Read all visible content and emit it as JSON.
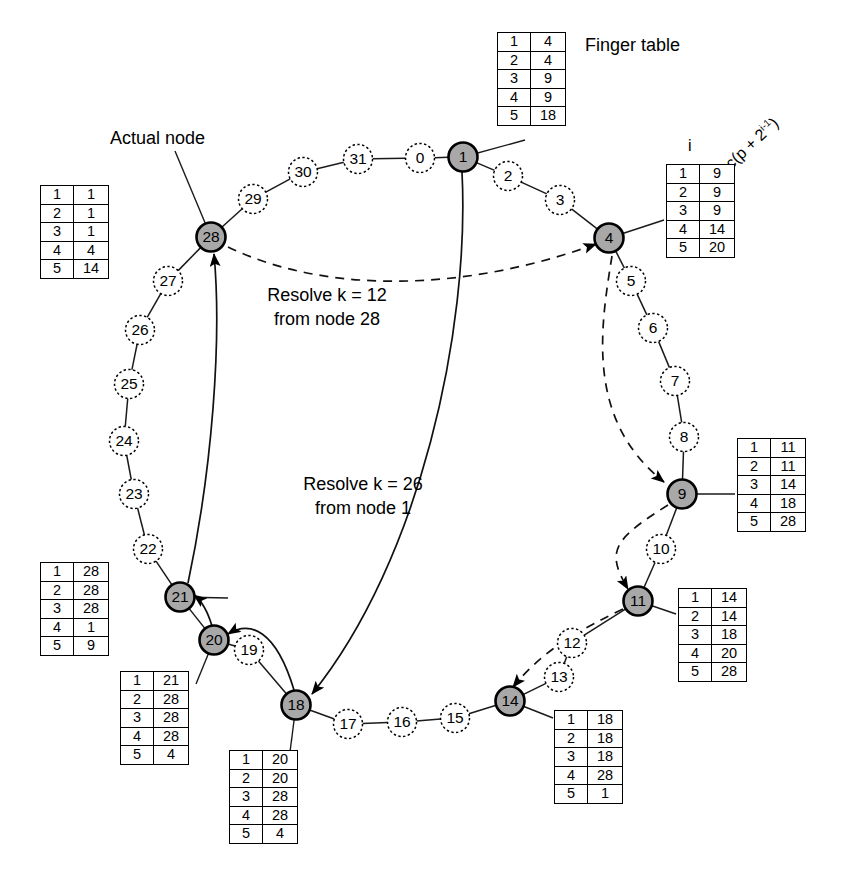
{
  "diagram": {
    "ring_size": 32,
    "annotations": {
      "actual_node": "Actual node",
      "finger_table": "Finger table",
      "header_i": "i",
      "header_succ_prefix": "succ(p + 2",
      "header_succ_sup": "i-1",
      "header_succ_suffix": ")",
      "resolve_12_line1": "Resolve k = 12",
      "resolve_12_line2": "from node 28",
      "resolve_26_line1": "Resolve k = 26",
      "resolve_26_line2": "from node 1"
    },
    "colors": {
      "actual_node_fill": "#a8a8a8",
      "virtual_node_fill": "#ffffff",
      "stroke": "#000000"
    },
    "actual_nodes": [
      1,
      4,
      9,
      11,
      14,
      18,
      20,
      21,
      28
    ],
    "virtual_nodes": [
      0,
      2,
      3,
      5,
      6,
      7,
      8,
      10,
      12,
      13,
      15,
      16,
      17,
      19,
      22,
      23,
      24,
      25,
      26,
      27,
      29,
      30,
      31
    ],
    "node_positions": {
      "0": [
        420,
        158
      ],
      "1": [
        463,
        157
      ],
      "2": [
        508,
        176
      ],
      "3": [
        560,
        200
      ],
      "4": [
        609,
        238
      ],
      "5": [
        631,
        281
      ],
      "6": [
        653,
        328
      ],
      "7": [
        675,
        381
      ],
      "8": [
        684,
        437
      ],
      "9": [
        682,
        494
      ],
      "10": [
        661,
        549
      ],
      "11": [
        638,
        601
      ],
      "12": [
        572,
        643
      ],
      "13": [
        559,
        677
      ],
      "14": [
        510,
        701
      ],
      "15": [
        455,
        718
      ],
      "16": [
        402,
        722
      ],
      "17": [
        348,
        724
      ],
      "18": [
        296,
        705
      ],
      "19": [
        249,
        650
      ],
      "20": [
        214,
        640
      ],
      "21": [
        180,
        597
      ],
      "22": [
        148,
        549
      ],
      "23": [
        134,
        494
      ],
      "24": [
        124,
        441
      ],
      "25": [
        129,
        384
      ],
      "26": [
        140,
        330
      ],
      "27": [
        168,
        281
      ],
      "28": [
        211,
        237
      ],
      "29": [
        253,
        199
      ],
      "30": [
        303,
        172
      ],
      "31": [
        358,
        159
      ]
    },
    "finger_tables": [
      {
        "node": 1,
        "rows": [
          [
            1,
            4
          ],
          [
            2,
            4
          ],
          [
            3,
            9
          ],
          [
            4,
            9
          ],
          [
            5,
            18
          ]
        ]
      },
      {
        "node": 4,
        "rows": [
          [
            1,
            9
          ],
          [
            2,
            9
          ],
          [
            3,
            9
          ],
          [
            4,
            14
          ],
          [
            5,
            20
          ]
        ]
      },
      {
        "node": 9,
        "rows": [
          [
            1,
            11
          ],
          [
            2,
            11
          ],
          [
            3,
            14
          ],
          [
            4,
            18
          ],
          [
            5,
            28
          ]
        ]
      },
      {
        "node": 11,
        "rows": [
          [
            1,
            14
          ],
          [
            2,
            14
          ],
          [
            3,
            18
          ],
          [
            4,
            20
          ],
          [
            5,
            28
          ]
        ]
      },
      {
        "node": 14,
        "rows": [
          [
            1,
            18
          ],
          [
            2,
            18
          ],
          [
            3,
            18
          ],
          [
            4,
            28
          ],
          [
            5,
            1
          ]
        ]
      },
      {
        "node": 18,
        "rows": [
          [
            1,
            20
          ],
          [
            2,
            20
          ],
          [
            3,
            28
          ],
          [
            4,
            28
          ],
          [
            5,
            4
          ]
        ]
      },
      {
        "node": 20,
        "rows": [
          [
            1,
            21
          ],
          [
            2,
            28
          ],
          [
            3,
            28
          ],
          [
            4,
            28
          ],
          [
            5,
            4
          ]
        ]
      },
      {
        "node": 21,
        "rows": [
          [
            1,
            28
          ],
          [
            2,
            28
          ],
          [
            3,
            28
          ],
          [
            4,
            1
          ],
          [
            5,
            9
          ]
        ]
      },
      {
        "node": 28,
        "rows": [
          [
            1,
            1
          ],
          [
            2,
            1
          ],
          [
            3,
            1
          ],
          [
            4,
            4
          ],
          [
            5,
            14
          ]
        ]
      }
    ],
    "lookup_paths": [
      {
        "key": 12,
        "from": 28,
        "style": "dashed",
        "hops": [
          28,
          4,
          9,
          11,
          14
        ]
      },
      {
        "key": 26,
        "from": 1,
        "style": "solid",
        "hops": [
          1,
          18,
          20,
          21,
          28
        ]
      }
    ]
  }
}
